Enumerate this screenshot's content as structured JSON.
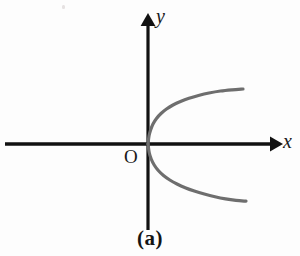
{
  "figure": {
    "caption": "(a)",
    "background_color": "#fdfdfd",
    "width": 300,
    "height": 256
  },
  "labels": {
    "y_axis": "y",
    "x_axis": "x",
    "origin": "O"
  },
  "chart_data": {
    "type": "line",
    "title": "(a)",
    "xlabel": "x",
    "ylabel": "y",
    "grid": false,
    "legend": false,
    "axis_color": "#111111",
    "curve_color": "#6e6e6e",
    "curve_width": 3.2,
    "origin_px": [
      148,
      144
    ],
    "xlim": [
      -1.55,
      1.45
    ],
    "ylim": [
      -1.0,
      1.4
    ],
    "equation": "x = y^2",
    "series": [
      {
        "name": "x = y^2",
        "points_px": [
          [
            148.0,
            144.0
          ],
          [
            149.0,
            136.0
          ],
          [
            150.6,
            130.0
          ],
          [
            153.0,
            124.0
          ],
          [
            156.5,
            118.5
          ],
          [
            161.0,
            113.5
          ],
          [
            166.5,
            109.0
          ],
          [
            173.0,
            105.0
          ],
          [
            180.5,
            101.5
          ],
          [
            189.0,
            98.3
          ],
          [
            198.5,
            95.5
          ],
          [
            209.0,
            93.0
          ],
          [
            220.5,
            91.0
          ],
          [
            232.0,
            89.8
          ],
          [
            243.0,
            89.0
          ],
          [
            148.0,
            144.0
          ],
          [
            149.2,
            152.5
          ],
          [
            151.2,
            159.0
          ],
          [
            154.2,
            165.0
          ],
          [
            158.3,
            170.5
          ],
          [
            163.5,
            175.5
          ],
          [
            169.8,
            180.0
          ],
          [
            177.0,
            184.0
          ],
          [
            185.2,
            187.7
          ],
          [
            194.3,
            191.0
          ],
          [
            204.3,
            194.0
          ],
          [
            215.0,
            196.7
          ],
          [
            225.5,
            198.8
          ],
          [
            236.0,
            200.3
          ],
          [
            246.0,
            201.2
          ]
        ]
      }
    ],
    "axes": {
      "x_axis_px": {
        "y": 144,
        "x_start": 5,
        "x_end": 278,
        "arrow": "right"
      },
      "y_axis_px": {
        "x": 148,
        "y_start": 230,
        "y_end": 17,
        "arrow": "up"
      }
    }
  }
}
